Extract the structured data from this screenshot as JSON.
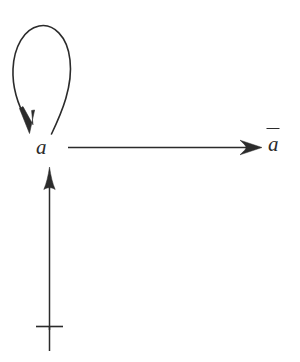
{
  "diagram": {
    "type": "directed-graph",
    "background_color": "#ffffff",
    "stroke_color": "#2b2b2b",
    "nodes": [
      {
        "id": "a",
        "label": "a",
        "style": "math-italic",
        "x": 50,
        "y": 147
      },
      {
        "id": "abar",
        "label": "a",
        "accent": "macron",
        "style": "math-italic",
        "x": 275,
        "y": 145
      },
      {
        "id": "top",
        "label": "⊤",
        "style": "math-symbol",
        "x": 49,
        "y": 329
      }
    ],
    "edges": [
      {
        "id": "self-loop",
        "from": "a",
        "to": "a",
        "shape": "teardrop-loop",
        "direction": "counterclockwise",
        "arrowhead": "down-left",
        "label": ""
      },
      {
        "id": "a-to-abar",
        "from": "a",
        "to": "abar",
        "shape": "straight",
        "direction": "rightward",
        "arrowhead": "right",
        "label": ""
      },
      {
        "id": "top-to-a",
        "from": "top",
        "to": "a",
        "shape": "straight",
        "direction": "upward",
        "arrowhead": "up",
        "label": ""
      }
    ]
  },
  "labels": {
    "node_a": "a",
    "node_abar": "a",
    "node_top": "⊤"
  }
}
